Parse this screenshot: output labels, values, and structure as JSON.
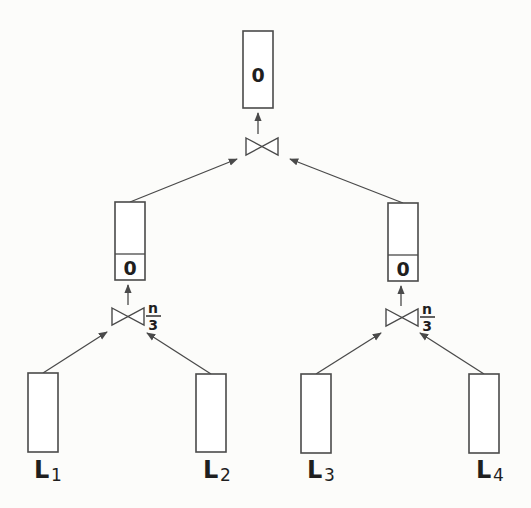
{
  "diagram": {
    "root": {
      "value": "0"
    },
    "root_join": {
      "symbol": "bowtie"
    },
    "left_subtree": {
      "result_value": "0",
      "join_symbol": "bowtie",
      "join_label_num": "n",
      "join_label_den": "3"
    },
    "right_subtree": {
      "result_value": "0",
      "join_symbol": "bowtie",
      "join_label_num": "n",
      "join_label_den": "3"
    },
    "leaves": [
      {
        "main": "L",
        "sub": "1"
      },
      {
        "main": "L",
        "sub": "2"
      },
      {
        "main": "L",
        "sub": "3"
      },
      {
        "main": "L",
        "sub": "4"
      }
    ],
    "colors": {
      "stroke": "#4a4a4a",
      "text": "#1f1f1f",
      "background": "#fcfcfa"
    }
  }
}
